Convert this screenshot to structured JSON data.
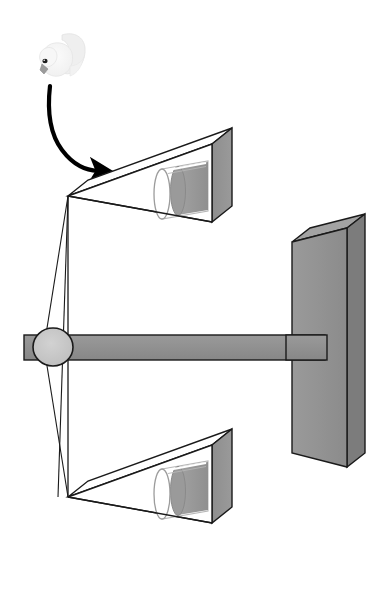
{
  "figure": {
    "title": "Two-choice acoustic playback apparatus with perch and approaching bird",
    "background_color": "#ffffff",
    "width": 379,
    "height": 610
  },
  "palette": {
    "outline": "#1a1a1a",
    "speaker_face_fill": "#ffffff",
    "speaker_side_fill": "#939393",
    "speaker_side_dark": "#7e7e7e",
    "post_front_fill": "#939393",
    "post_side_fill": "#7c7c7c",
    "bar_fill": "#8f8f8f",
    "pivot_fill": "#c4c4c4",
    "cylinder_outer_fill": "#ffffff",
    "cylinder_inner_fill": "#9a9a9a",
    "cylinder_shadow_fill": "#8c8c8c",
    "bird_body_fill": "#f4f4f4",
    "bird_wing_fill": "#ececec",
    "bird_beak_fill": "#9b9b9b",
    "bird_eye_fill": "#1c1c1c",
    "arrow_stroke": "#000000"
  },
  "elements": {
    "bird": {
      "name": "white dove",
      "label": "",
      "position": {
        "x": 55,
        "y": 55
      },
      "eye_color": "#1c1c1c",
      "beak_color": "#9b9b9b"
    },
    "approach_arrow": {
      "name": "curved approach arrow",
      "label": "",
      "from": {
        "x": 50,
        "y": 86
      },
      "to": {
        "x": 105,
        "y": 172
      },
      "stroke_width": 4
    },
    "top_speaker": {
      "name": "upper speaker horn",
      "label": "",
      "apex": {
        "x": 68,
        "y": 196
      },
      "mouth_top": {
        "x": 212,
        "y": 144
      },
      "mouth_bottom": {
        "x": 212,
        "y": 222
      },
      "depth_offset": {
        "x": 20,
        "y": -16
      }
    },
    "bottom_speaker": {
      "name": "lower speaker horn",
      "label": "",
      "apex": {
        "x": 68,
        "y": 497
      },
      "mouth_top": {
        "x": 212,
        "y": 445
      },
      "mouth_bottom": {
        "x": 212,
        "y": 523
      },
      "depth_offset": {
        "x": 20,
        "y": -16
      }
    },
    "top_cylinder": {
      "name": "upper speaker cone cylinder",
      "label": "",
      "front_center": {
        "x": 162,
        "y": 194
      },
      "back_center": {
        "x": 208,
        "y": 186
      },
      "radius_x": 8,
      "radius_y": 25
    },
    "bottom_cylinder": {
      "name": "lower speaker cone cylinder",
      "label": "",
      "front_center": {
        "x": 162,
        "y": 494
      },
      "back_center": {
        "x": 208,
        "y": 486
      },
      "radius_x": 8,
      "radius_y": 25
    },
    "horizontal_bar": {
      "name": "horizontal perch bar",
      "label": "",
      "left": {
        "x": 24,
        "y": 337
      },
      "right": {
        "x": 325,
        "y": 337
      },
      "height": 25
    },
    "pivot": {
      "name": "pivot hub",
      "label": "",
      "center": {
        "x": 53,
        "y": 347
      },
      "radius_x": 20,
      "radius_y": 19
    },
    "vertical_post": {
      "name": "vertical support post",
      "label": "",
      "front_top_left": {
        "x": 292,
        "y": 242
      },
      "front_bottom_right": {
        "x": 347,
        "y": 467
      },
      "depth_offset": {
        "x": 18,
        "y": -14
      }
    },
    "frame_lines": {
      "name": "wire frame struts",
      "label": "",
      "vertical": {
        "x": 68,
        "y1": 196,
        "y2": 497
      },
      "diagonals": [
        {
          "x1": 68,
          "y1": 196,
          "x2": 53,
          "y2": 347
        },
        {
          "x1": 53,
          "y1": 347,
          "x2": 68,
          "y2": 497
        },
        {
          "x1": 68,
          "y1": 196,
          "x2": 62,
          "y2": 497
        }
      ]
    }
  }
}
